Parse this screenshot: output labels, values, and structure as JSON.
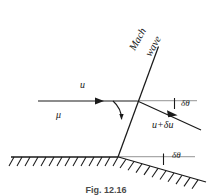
{
  "figure": {
    "domain": "Diagram",
    "caption": "Fig. 12.16",
    "background_color": "#ffffff",
    "line_color": "#1a1a1a",
    "reference_line_color": "#a8a8a8",
    "labels": {
      "mach_wave_line_1": "Mach",
      "mach_wave_line_2": "wave",
      "upstream_velocity": "u",
      "mach_angle": "μ",
      "deflection_angle_upper": "δθ",
      "downstream_velocity": "u+δu",
      "deflection_angle_lower": "δθ"
    },
    "geometry": {
      "mach_wave_top": [
        158,
        47
      ],
      "mach_wave_intersection": [
        137,
        101
      ],
      "mach_wave_bottom": [
        118,
        157
      ],
      "upstream_flow_start": [
        38,
        101
      ],
      "upstream_arrow_head": [
        103,
        101
      ],
      "downstream_flow_end": [
        200,
        129
      ],
      "wall_left": [
        12,
        157
      ],
      "wall_kink": [
        118,
        157
      ],
      "wall_right": [
        205,
        181
      ],
      "reference_line_upper": [
        [
          137,
          101
        ],
        [
          196,
          101
        ]
      ],
      "reference_line_lower": [
        [
          118,
          157
        ],
        [
          196,
          157
        ]
      ]
    }
  }
}
